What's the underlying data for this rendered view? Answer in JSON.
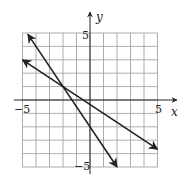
{
  "chart_data": {
    "type": "line",
    "title": "",
    "xlabel": "x",
    "ylabel": "y",
    "xlim": [
      -5,
      5
    ],
    "ylim": [
      -5,
      5
    ],
    "grid": true,
    "grid_step": 1,
    "tick_labels": {
      "x": [
        "-5",
        "5"
      ],
      "y": [
        "5",
        "-5"
      ]
    },
    "series": [
      {
        "name": "steep line",
        "equation": "y = -1.5x - 2",
        "points": [
          [
            -4.6,
            4.9
          ],
          [
            2.0,
            -5.0
          ]
        ],
        "arrows_both_ends": true
      },
      {
        "name": "shallow line",
        "equation": "y = -(2/3)x - 1/3",
        "points": [
          [
            -5.0,
            3.0
          ],
          [
            5.0,
            -3.67
          ]
        ],
        "arrows_both_ends": true
      }
    ],
    "intersection": [
      -2,
      1
    ],
    "colors": {
      "grid": "#9a9a9a",
      "axes": "#222222",
      "lines": "#222222"
    }
  },
  "labels": {
    "x_axis": "x",
    "y_axis": "y",
    "x_min": "−5",
    "x_max": "5",
    "y_max": "5",
    "y_min": "−5"
  }
}
